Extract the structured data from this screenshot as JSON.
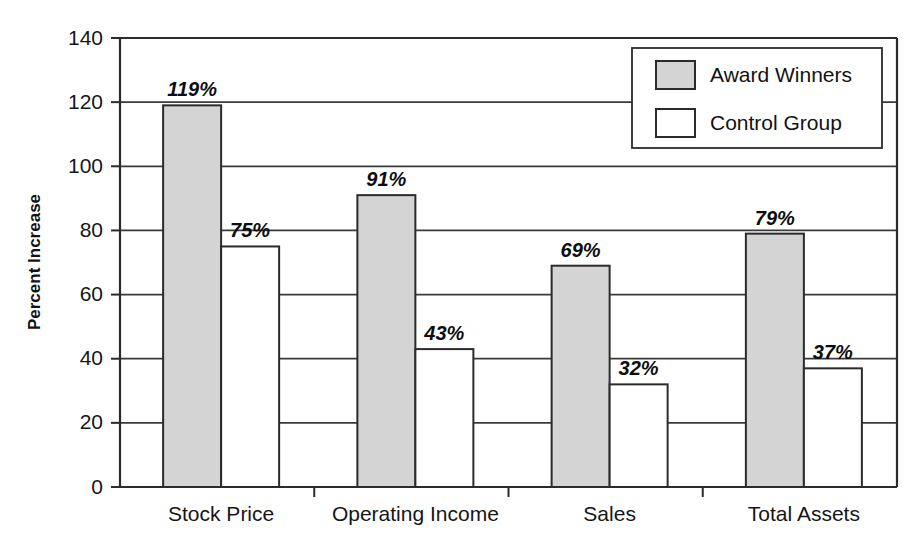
{
  "chart_data": {
    "type": "bar",
    "title": "",
    "subtitle": "",
    "xlabel": "",
    "ylabel": "Percent Increase",
    "ylim": [
      0,
      140
    ],
    "ytick_step": 20,
    "yticks": [
      "0",
      "20",
      "40",
      "60",
      "80",
      "100",
      "120",
      "140"
    ],
    "grid": "horizontal",
    "legend_position": "top-right",
    "categories": [
      "Stock Price",
      "Operating Income",
      "Sales",
      "Total Assets"
    ],
    "series": [
      {
        "name": "Award Winners",
        "color": "#d4d4d4",
        "values": [
          119,
          91,
          69,
          79
        ],
        "labels": [
          "119%",
          "91%",
          "69%",
          "79%"
        ]
      },
      {
        "name": "Control Group",
        "color": "#ffffff",
        "values": [
          75,
          43,
          32,
          37
        ],
        "labels": [
          "75%",
          "43%",
          "32%",
          "37%"
        ]
      }
    ]
  },
  "legend": {
    "entries": [
      {
        "label": "Award Winners",
        "swatch": "#d4d4d4"
      },
      {
        "label": "Control Group",
        "swatch": "#ffffff"
      }
    ]
  },
  "colors": {
    "award_winners_fill": "#d4d4d4",
    "control_group_fill": "#ffffff",
    "outline": "#2b2b2b",
    "grid": "#3a3a3a",
    "text": "#161616",
    "background": "#ffffff"
  }
}
